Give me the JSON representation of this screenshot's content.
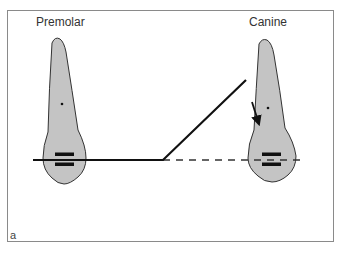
{
  "labels": {
    "premolar": "Premolar",
    "canine": "Canine",
    "panel": "a"
  },
  "colors": {
    "tooth_fill": "#c4c4c4",
    "tooth_stroke": "#333333",
    "wire": "#111111",
    "frame": "#8a8a8a",
    "background": "#ffffff"
  },
  "elements": {
    "premolar_tooth": {
      "centroid_dot": [
        62,
        104
      ],
      "brackets_y": [
        154,
        164
      ]
    },
    "canine_tooth": {
      "centroid_dot": [
        268,
        108
      ],
      "brackets_y": [
        154,
        164
      ]
    },
    "archwire": {
      "style": "solid",
      "path": [
        [
          33,
          160
        ],
        [
          163,
          160
        ],
        [
          246,
          80
        ]
      ]
    },
    "reference_line": {
      "style": "dashed",
      "from": [
        163,
        160
      ],
      "to": [
        298,
        160
      ]
    },
    "force_arrow": {
      "from": [
        252,
        102
      ],
      "to": [
        259,
        124
      ]
    }
  }
}
